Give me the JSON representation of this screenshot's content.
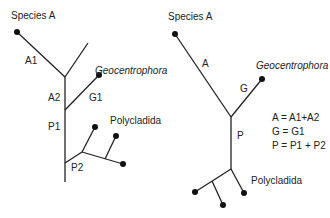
{
  "left_tree": {
    "species_a": "Species A",
    "geocentrophora": "Geocentrophora",
    "polycladida": "Polycladida",
    "branches": {
      "a1": "A1",
      "a2": "A2",
      "g1": "G1",
      "p1": "P1",
      "p2": "P2"
    }
  },
  "right_tree": {
    "species_a": "Species A",
    "geocentrophora": "Geocentrophora",
    "polycladida": "Polycladida",
    "branches": {
      "a": "A",
      "g": "G",
      "p": "P"
    }
  },
  "legend": [
    "A = A1+A2",
    "G = G1",
    "P = P1 + P2"
  ],
  "colors": {
    "line": "#222222",
    "text": "#222222"
  }
}
